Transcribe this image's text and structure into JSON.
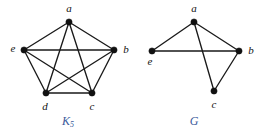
{
  "figure": {
    "background_color": "#ffffff",
    "edge_color": "#1a1a1a",
    "vertex_color": "#111111",
    "caption_color": "#3a5a9b"
  },
  "graphs": [
    {
      "id": "k5",
      "caption": "K",
      "caption_subscript": "5",
      "vertices": [
        {
          "label": "a",
          "x": 69,
          "y": 22,
          "label_x": 69,
          "label_y": 9
        },
        {
          "label": "b",
          "x": 114,
          "y": 50,
          "label_x": 126,
          "label_y": 50
        },
        {
          "label": "c",
          "x": 92,
          "y": 93,
          "label_x": 92,
          "label_y": 107
        },
        {
          "label": "d",
          "x": 46,
          "y": 93,
          "label_x": 45,
          "label_y": 107
        },
        {
          "label": "e",
          "x": 24,
          "y": 50,
          "label_x": 13,
          "label_y": 49
        }
      ],
      "edges": [
        [
          "a",
          "b"
        ],
        [
          "b",
          "c"
        ],
        [
          "c",
          "d"
        ],
        [
          "d",
          "e"
        ],
        [
          "e",
          "a"
        ],
        [
          "a",
          "c"
        ],
        [
          "a",
          "d"
        ],
        [
          "b",
          "d"
        ],
        [
          "b",
          "e"
        ],
        [
          "c",
          "e"
        ]
      ],
      "edge_count": 10,
      "caption_x": 68,
      "caption_y": 122
    },
    {
      "id": "g",
      "caption": "G",
      "caption_subscript": "",
      "vertices": [
        {
          "label": "a",
          "x": 194,
          "y": 22,
          "label_x": 194,
          "label_y": 9
        },
        {
          "label": "b",
          "x": 239,
          "y": 51,
          "label_x": 251,
          "label_y": 51
        },
        {
          "label": "c",
          "x": 214,
          "y": 91,
          "label_x": 214,
          "label_y": 105
        },
        {
          "label": "e",
          "x": 152,
          "y": 51,
          "label_x": 150,
          "label_y": 62
        }
      ],
      "edges": [
        [
          "a",
          "e"
        ],
        [
          "a",
          "b"
        ],
        [
          "a",
          "c"
        ],
        [
          "e",
          "b"
        ],
        [
          "b",
          "c"
        ]
      ],
      "edge_count": 5,
      "caption_x": 194,
      "caption_y": 122
    }
  ]
}
